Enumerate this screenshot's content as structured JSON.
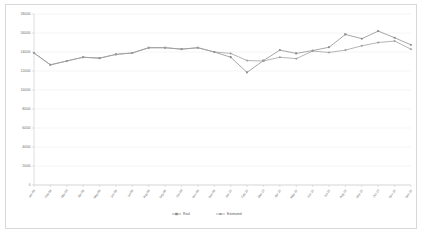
{
  "chart_data": {
    "type": "line",
    "title": "",
    "xlabel": "",
    "ylabel": "",
    "ylim": [
      0,
      180000
    ],
    "ytick_step": 20000,
    "grid": true,
    "legend_position": "bottom",
    "yticks": [
      "0",
      "20000",
      "40000",
      "60000",
      "80000",
      "100000",
      "120000",
      "140000",
      "160000",
      "180000"
    ],
    "categories": [
      "Jan-09",
      "Feb-09",
      "Mar-09",
      "Apr-09",
      "May-09",
      "Jun-09",
      "Jul-09",
      "Aug-09",
      "Sep-09",
      "Oct-09",
      "Nov-09",
      "Dec-09",
      "Jan-10",
      "Feb-10",
      "Mar-10",
      "Apr-10",
      "May-10",
      "Jun-10",
      "Jul-10",
      "Aug-10",
      "Sep-10",
      "Oct-10",
      "Nov-10",
      "Dec-10"
    ],
    "series": [
      {
        "name": "Real",
        "color": "#8a8a8a",
        "values": [
          139000,
          126500,
          130500,
          134500,
          133500,
          137500,
          139000,
          144500,
          144500,
          143000,
          144500,
          140000,
          134500,
          118500,
          131000,
          142000,
          138500,
          141500,
          145000,
          158500,
          154000,
          162000,
          155000,
          147500
        ]
      },
      {
        "name": "Estimated",
        "color": "#9c9c9c",
        "values": [
          139000,
          126500,
          130500,
          134500,
          133500,
          137500,
          139000,
          144500,
          144500,
          143000,
          144500,
          140000,
          138500,
          131000,
          130500,
          134500,
          133000,
          141000,
          139500,
          142000,
          146500,
          150000,
          151500,
          143000
        ]
      }
    ],
    "legend": [
      {
        "label": "Real",
        "color": "#8a8a8a"
      },
      {
        "label": "Estimated",
        "color": "#9c9c9c"
      }
    ]
  }
}
